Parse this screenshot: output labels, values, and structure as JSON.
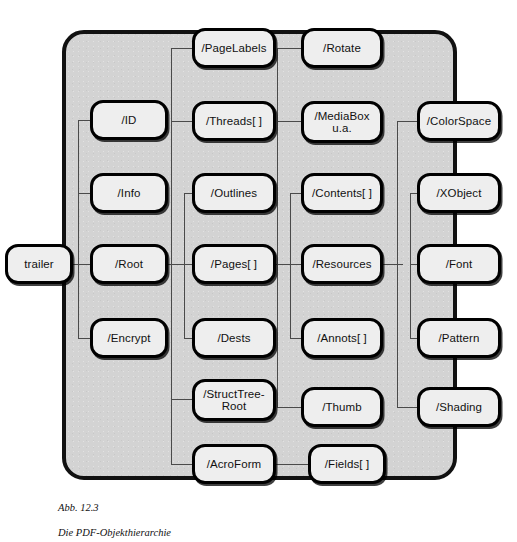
{
  "figure": {
    "caption_label": "Abb. 12.3",
    "caption_title": "Die PDF-Objekthierarchie",
    "panel_color": "#d3d3d3",
    "node_fill": "#eeeeee",
    "node_border": "#000000",
    "line_color": "#4a4a4a"
  },
  "nodes": {
    "trailer": {
      "label": "trailer"
    },
    "id": {
      "label": "/ID"
    },
    "info": {
      "label": "/Info"
    },
    "root": {
      "label": "/Root"
    },
    "encrypt": {
      "label": "/Encrypt"
    },
    "pagelabels": {
      "label": "/PageLabels"
    },
    "threads": {
      "label": "/Threads[ ]"
    },
    "outlines": {
      "label": "/Outlines"
    },
    "pages": {
      "label": "/Pages[ ]"
    },
    "dests": {
      "label": "/Dests"
    },
    "structtreeroot": {
      "label": "/StructTree-\nRoot"
    },
    "acroform": {
      "label": "/AcroForm"
    },
    "rotate": {
      "label": "/Rotate"
    },
    "mediabox": {
      "label": "/MediaBox\nu.a."
    },
    "contents": {
      "label": "/Contents[ ]"
    },
    "resources": {
      "label": "/Resources"
    },
    "annots": {
      "label": "/Annots[ ]"
    },
    "thumb": {
      "label": "/Thumb"
    },
    "fields": {
      "label": "/Fields[ ]"
    },
    "colorspace": {
      "label": "/ColorSpace"
    },
    "xobject": {
      "label": "/XObject"
    },
    "font": {
      "label": "/Font"
    },
    "pattern": {
      "label": "/Pattern"
    },
    "shading": {
      "label": "/Shading"
    }
  }
}
